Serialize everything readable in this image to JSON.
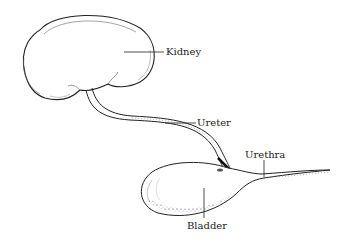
{
  "diagram": {
    "type": "anatomical illustration",
    "labels": {
      "kidney": "Kidney",
      "ureter": "Ureter",
      "urethra": "Urethra",
      "bladder": "Bladder"
    },
    "colors": {
      "ink": "#222222",
      "background": "#ffffff"
    }
  }
}
